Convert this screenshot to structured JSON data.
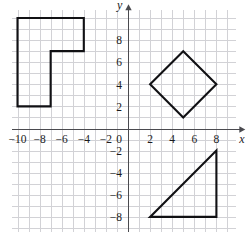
{
  "chart_data": {
    "type": "scatter",
    "title": "",
    "xlabel": "x",
    "ylabel": "y",
    "xlim": [
      -10.5,
      9.8
    ],
    "ylim": [
      -9.4,
      10.7
    ],
    "grid": true,
    "grid_step": 1,
    "legend": "none",
    "axis_origin": [
      0,
      0
    ],
    "x_tick_labels": [
      "-10",
      "-8",
      "-6",
      "-4",
      "-2",
      "0",
      "2",
      "4",
      "6",
      "8"
    ],
    "x_tick_values": [
      -10,
      -8,
      -6,
      -4,
      -2,
      0,
      2,
      4,
      6,
      8
    ],
    "y_tick_labels": [
      "8",
      "6",
      "4",
      "2",
      "-2",
      "-4",
      "-6",
      "-8"
    ],
    "y_tick_values": [
      8,
      6,
      4,
      2,
      -2,
      -4,
      -6,
      -8
    ],
    "origin_label": "0",
    "shapes": [
      {
        "name": "l-shape-hexagon",
        "type": "polygon",
        "quadrant": "second",
        "closed": true,
        "vertices": [
          [
            -10,
            10
          ],
          [
            -4,
            10
          ],
          [
            -4,
            7
          ],
          [
            -7,
            7
          ],
          [
            -7,
            2
          ],
          [
            -10,
            2
          ]
        ]
      },
      {
        "name": "diamond-square",
        "type": "polygon",
        "quadrant": "first",
        "closed": true,
        "vertices": [
          [
            5,
            7
          ],
          [
            8,
            4
          ],
          [
            5,
            1
          ],
          [
            2,
            4
          ]
        ]
      },
      {
        "name": "right-triangle",
        "type": "polygon",
        "quadrant": "fourth",
        "closed": true,
        "vertices": [
          [
            2,
            -8
          ],
          [
            8,
            -8
          ],
          [
            8,
            -2
          ]
        ]
      }
    ]
  },
  "figure": {
    "caption": "",
    "x_axis_name": "x",
    "y_axis_name": "y"
  }
}
